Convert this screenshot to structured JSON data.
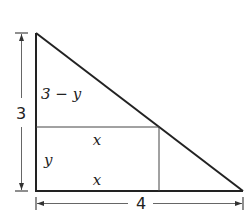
{
  "diagram": {
    "type": "right-triangle-inscribed-rectangle",
    "colors": {
      "stroke": "#222222",
      "thin": "#444444",
      "background": "#ffffff"
    },
    "labels": {
      "height": "3",
      "base": "4",
      "upper_segment": "3 − y",
      "rect_height": "y",
      "rect_top_width": "x",
      "rect_bottom_width": "x"
    },
    "dimensions": {
      "vertical": {
        "label": "3",
        "from": "top vertex",
        "to": "bottom-left vertex"
      },
      "horizontal": {
        "label": "4",
        "from": "bottom-left vertex",
        "to": "bottom-right vertex"
      }
    }
  }
}
